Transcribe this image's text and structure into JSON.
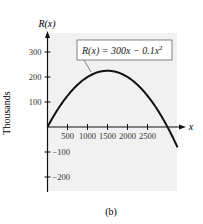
{
  "chart_data": {
    "type": "line",
    "title": "",
    "function_label": "R(x) = 300x − 0.1x²",
    "xlabel": "x",
    "ylabel": "R(x)",
    "y_units_label": "Thousands",
    "caption": "(b)",
    "xlim": [
      0,
      3300
    ],
    "ylim": [
      -250,
      350
    ],
    "x_ticks": [
      500,
      1000,
      1500,
      2000,
      2500
    ],
    "x_tick_labels": [
      "500",
      "1000",
      "1500",
      "2000",
      "2500"
    ],
    "y_ticks": [
      300,
      200,
      100,
      -100,
      -200
    ],
    "y_tick_labels": [
      "300",
      "200",
      "100",
      "−100",
      "−200"
    ],
    "grid": false,
    "legend": null,
    "series": [
      {
        "name": "R(x) = 300x − 0.1x²",
        "x": [
          0,
          250,
          500,
          750,
          1000,
          1250,
          1500,
          1750,
          2000,
          2250,
          2500,
          2750,
          3000,
          3250
        ],
        "values": [
          0,
          68.75,
          125,
          168.75,
          200,
          218.75,
          225,
          218.75,
          200,
          168.75,
          125,
          68.75,
          0,
          -81.25
        ]
      }
    ],
    "annotations": [
      {
        "text": "R(x) = 300x − 0.1x²",
        "points_to": [
          875,
          180
        ]
      }
    ]
  },
  "labels": {
    "y_axis": "R(x)",
    "x_axis": "x",
    "units": "Thousands",
    "caption": "(b)",
    "equation_prefix": "R(x) = 300x − 0.1x",
    "equation_exp": "2"
  },
  "colors": {
    "panel_bg": "#f1f1f1",
    "curve": "#111111",
    "axis": "#111111",
    "text": "#333333"
  }
}
